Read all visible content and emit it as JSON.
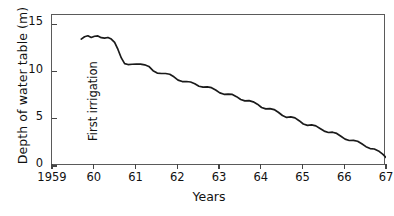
{
  "chart_data": {
    "type": "line",
    "title": "",
    "xlabel": "Years",
    "ylabel": "Depth of water table (m)",
    "xlim": [
      1959,
      1967
    ],
    "ylim": [
      16,
      0
    ],
    "y_inverted": true,
    "grid": false,
    "legend": "none",
    "yticks": [
      {
        "value": 0,
        "label": "0"
      },
      {
        "value": 5,
        "label": "5"
      },
      {
        "value": 10,
        "label": "10"
      },
      {
        "value": 15,
        "label": "15"
      }
    ],
    "xticks": [
      {
        "value": 1959,
        "label": "1959"
      },
      {
        "value": 1960,
        "label": "60"
      },
      {
        "value": 1961,
        "label": "61"
      },
      {
        "value": 1962,
        "label": "62"
      },
      {
        "value": 1963,
        "label": "63"
      },
      {
        "value": 1964,
        "label": "64"
      },
      {
        "value": 1965,
        "label": "65"
      },
      {
        "value": 1966,
        "label": "66"
      },
      {
        "value": 1967,
        "label": "67"
      }
    ],
    "annotations": [
      {
        "text": "First irrigation",
        "x": 1960.0,
        "rotation": -90
      }
    ],
    "series": [
      {
        "name": "Depth of water table",
        "color": "#1a1a1a",
        "x": [
          1959.7,
          1959.78,
          1959.86,
          1959.94,
          1960.02,
          1960.1,
          1960.18,
          1960.26,
          1960.34,
          1960.42,
          1960.5,
          1960.58,
          1960.66,
          1960.74,
          1960.82,
          1960.92,
          1961.02,
          1961.12,
          1961.22,
          1961.32,
          1961.42,
          1961.52,
          1961.62,
          1961.72,
          1961.82,
          1961.92,
          1962.02,
          1962.12,
          1962.22,
          1962.32,
          1962.42,
          1962.52,
          1962.62,
          1962.72,
          1962.82,
          1962.92,
          1963.02,
          1963.12,
          1963.22,
          1963.32,
          1963.42,
          1963.52,
          1963.62,
          1963.72,
          1963.82,
          1963.92,
          1964.02,
          1964.12,
          1964.22,
          1964.32,
          1964.42,
          1964.52,
          1964.62,
          1964.72,
          1964.82,
          1964.92,
          1965.02,
          1965.12,
          1965.22,
          1965.32,
          1965.42,
          1965.52,
          1965.62,
          1965.72,
          1965.82,
          1965.92,
          1966.02,
          1966.12,
          1966.22,
          1966.32,
          1966.42,
          1966.52,
          1966.62,
          1966.72,
          1966.82,
          1966.92,
          1967.0
        ],
        "y": [
          13.45,
          13.7,
          13.8,
          13.62,
          13.75,
          13.78,
          13.6,
          13.55,
          13.62,
          13.45,
          13.1,
          12.35,
          11.45,
          10.85,
          10.75,
          10.78,
          10.8,
          10.8,
          10.72,
          10.55,
          10.1,
          9.85,
          9.8,
          9.8,
          9.72,
          9.45,
          9.1,
          8.95,
          8.95,
          8.9,
          8.72,
          8.45,
          8.35,
          8.38,
          8.3,
          8.05,
          7.75,
          7.6,
          7.62,
          7.58,
          7.35,
          7.05,
          6.9,
          6.92,
          6.8,
          6.55,
          6.2,
          6.05,
          6.08,
          5.98,
          5.7,
          5.35,
          5.15,
          5.2,
          5.1,
          4.8,
          4.45,
          4.3,
          4.35,
          4.25,
          3.98,
          3.7,
          3.55,
          3.58,
          3.45,
          3.15,
          2.85,
          2.7,
          2.72,
          2.62,
          2.35,
          2.05,
          1.85,
          1.8,
          1.6,
          1.25,
          0.9
        ]
      }
    ]
  }
}
